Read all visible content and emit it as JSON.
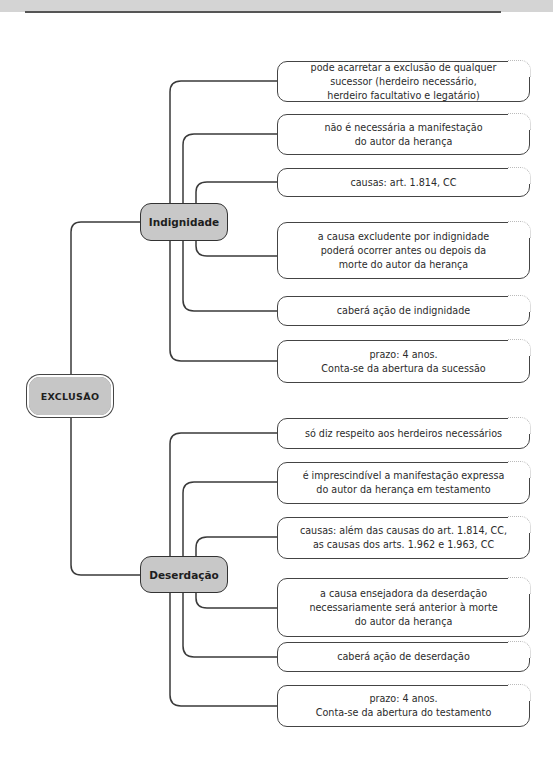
{
  "root": {
    "label": "EXCLUSÃO"
  },
  "branches": [
    {
      "label": "Indignidade",
      "items": [
        "pode acarretar a exclusão de qualquer\nsucessor (herdeiro necessário,\nherdeiro facultativo e legatário)",
        "não é necessária a manifestação\ndo autor da herança",
        "causas: art. 1.814, CC",
        "a causa excludente por indignidade\npoderá ocorrer antes ou depois da\nmorte do autor da herança",
        "caberá ação de indignidade",
        "prazo: 4 anos.\nConta-se da abertura da sucessão"
      ]
    },
    {
      "label": "Deserdação",
      "items": [
        "só diz respeito aos herdeiros necessários",
        "é imprescindível a manifestação expressa\ndo autor da herança em testamento",
        "causas: além das causas do art. 1.814, CC,\nas causas dos arts. 1.962 e 1.963, CC",
        "a causa ensejadora da deserdação\nnecessariamente será anterior à morte\ndo autor da herança",
        "caberá ação de deserdação",
        "prazo: 4 anos.\nConta-se da abertura do testamento"
      ]
    }
  ],
  "colors": {
    "node_fill": "#c8c8c8",
    "stroke": "#333333",
    "band": "#d4d4d4"
  }
}
